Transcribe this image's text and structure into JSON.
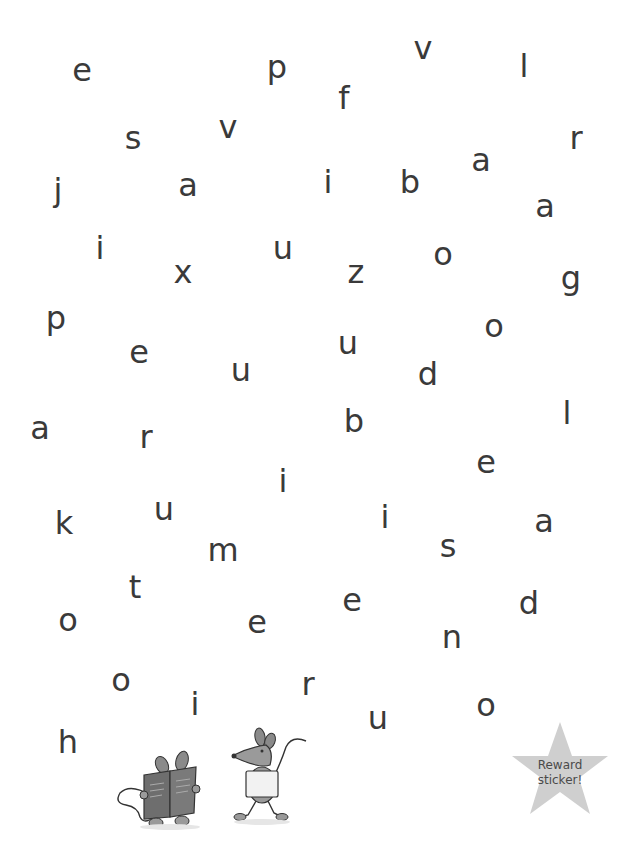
{
  "activity": {
    "letters": [
      {
        "char": "e",
        "x": 82,
        "y": 70
      },
      {
        "char": "p",
        "x": 277,
        "y": 67
      },
      {
        "char": "v",
        "x": 423,
        "y": 48
      },
      {
        "char": "l",
        "x": 524,
        "y": 66
      },
      {
        "char": "f",
        "x": 344,
        "y": 98
      },
      {
        "char": "s",
        "x": 133,
        "y": 138
      },
      {
        "char": "v",
        "x": 228,
        "y": 127
      },
      {
        "char": "r",
        "x": 576,
        "y": 138
      },
      {
        "char": "a",
        "x": 481,
        "y": 160
      },
      {
        "char": "j",
        "x": 58,
        "y": 190
      },
      {
        "char": "a",
        "x": 188,
        "y": 185
      },
      {
        "char": "i",
        "x": 328,
        "y": 182
      },
      {
        "char": "b",
        "x": 410,
        "y": 182
      },
      {
        "char": "a",
        "x": 545,
        "y": 206
      },
      {
        "char": "i",
        "x": 100,
        "y": 248
      },
      {
        "char": "x",
        "x": 183,
        "y": 272
      },
      {
        "char": "u",
        "x": 283,
        "y": 248
      },
      {
        "char": "z",
        "x": 356,
        "y": 272
      },
      {
        "char": "o",
        "x": 443,
        "y": 254
      },
      {
        "char": "g",
        "x": 571,
        "y": 278
      },
      {
        "char": "p",
        "x": 56,
        "y": 318
      },
      {
        "char": "o",
        "x": 494,
        "y": 326
      },
      {
        "char": "e",
        "x": 139,
        "y": 352
      },
      {
        "char": "u",
        "x": 348,
        "y": 343
      },
      {
        "char": "u",
        "x": 241,
        "y": 370
      },
      {
        "char": "d",
        "x": 428,
        "y": 374
      },
      {
        "char": "a",
        "x": 40,
        "y": 428
      },
      {
        "char": "r",
        "x": 146,
        "y": 437
      },
      {
        "char": "b",
        "x": 354,
        "y": 421
      },
      {
        "char": "l",
        "x": 567,
        "y": 413
      },
      {
        "char": "e",
        "x": 486,
        "y": 462
      },
      {
        "char": "i",
        "x": 283,
        "y": 481
      },
      {
        "char": "u",
        "x": 164,
        "y": 509
      },
      {
        "char": "k",
        "x": 64,
        "y": 523
      },
      {
        "char": "i",
        "x": 385,
        "y": 517
      },
      {
        "char": "a",
        "x": 544,
        "y": 521
      },
      {
        "char": "s",
        "x": 448,
        "y": 546
      },
      {
        "char": "m",
        "x": 223,
        "y": 550
      },
      {
        "char": "t",
        "x": 135,
        "y": 587
      },
      {
        "char": "e",
        "x": 352,
        "y": 600
      },
      {
        "char": "d",
        "x": 529,
        "y": 603
      },
      {
        "char": "o",
        "x": 68,
        "y": 620
      },
      {
        "char": "e",
        "x": 257,
        "y": 622
      },
      {
        "char": "n",
        "x": 452,
        "y": 637
      },
      {
        "char": "o",
        "x": 121,
        "y": 680
      },
      {
        "char": "r",
        "x": 308,
        "y": 684
      },
      {
        "char": "i",
        "x": 195,
        "y": 704
      },
      {
        "char": "o",
        "x": 486,
        "y": 705
      },
      {
        "char": "u",
        "x": 378,
        "y": 718
      },
      {
        "char": "h",
        "x": 68,
        "y": 742
      }
    ]
  },
  "illustration": {
    "mouse_reading": "mouse-reading-book",
    "mouse_walking": "mouse-walking-with-book"
  },
  "reward_sticker": {
    "line1": "Reward",
    "line2": "sticker!",
    "color": "#cfcfcf"
  },
  "colors": {
    "letter": "#3a3a3a",
    "background": "#ffffff"
  }
}
